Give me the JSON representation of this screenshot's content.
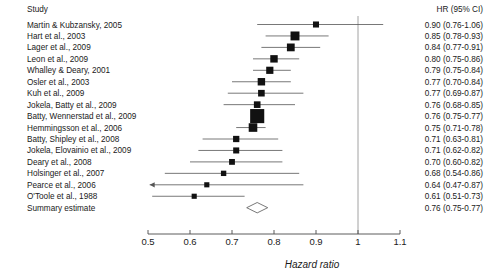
{
  "columns": {
    "study_header": "Study",
    "hr_header": "HR (95% CI)"
  },
  "axis": {
    "title": "Hazard ratio",
    "ticks": [
      "0.5",
      "0.6",
      "0.7",
      "0.8",
      "0.9",
      "1",
      "1.1"
    ],
    "tick_values": [
      0.5,
      0.6,
      0.7,
      0.8,
      0.9,
      1.0,
      1.1
    ],
    "xmin": 0.5,
    "xmax": 1.1,
    "null_value": 1.0
  },
  "chart_data": {
    "type": "forest",
    "title": "",
    "xlabel": "Hazard ratio",
    "ylabel": "",
    "xlim": [
      0.5,
      1.1
    ],
    "xscale": "linear",
    "grid": false,
    "legend": "none",
    "null_line": 1.0,
    "columns": [
      "Study",
      "HR (95% CI)"
    ],
    "studies": [
      {
        "label": "Martin & Kubzansky, 2005",
        "hr": 0.9,
        "lo": 0.76,
        "hi": 1.06,
        "text": "0.90 (0.76-1.06)",
        "weight": 0.3,
        "left_arrow": false,
        "right_arrow": false
      },
      {
        "label": "Hart et al., 2003",
        "hr": 0.85,
        "lo": 0.78,
        "hi": 0.93,
        "text": "0.85 (0.78-0.93)",
        "weight": 0.55,
        "left_arrow": false,
        "right_arrow": false
      },
      {
        "label": "Lager et al., 2009",
        "hr": 0.84,
        "lo": 0.77,
        "hi": 0.91,
        "text": "0.84 (0.77-0.91)",
        "weight": 0.45,
        "left_arrow": false,
        "right_arrow": false
      },
      {
        "label": "Leon et al., 2009",
        "hr": 0.8,
        "lo": 0.75,
        "hi": 0.86,
        "text": "0.80 (0.75-0.86)",
        "weight": 0.42,
        "left_arrow": false,
        "right_arrow": false
      },
      {
        "label": "Whalley & Deary, 2001",
        "hr": 0.79,
        "lo": 0.75,
        "hi": 0.84,
        "text": "0.79 (0.75-0.84)",
        "weight": 0.4,
        "left_arrow": false,
        "right_arrow": false
      },
      {
        "label": "Osler et al., 2003",
        "hr": 0.77,
        "lo": 0.7,
        "hi": 0.84,
        "text": "0.77 (0.70-0.84)",
        "weight": 0.42,
        "left_arrow": false,
        "right_arrow": false
      },
      {
        "label": "Kuh et al., 2009",
        "hr": 0.77,
        "lo": 0.69,
        "hi": 0.87,
        "text": "0.77 (0.69-0.87)",
        "weight": 0.35,
        "left_arrow": false,
        "right_arrow": false
      },
      {
        "label": "Jokela, Batty et al., 2009",
        "hr": 0.76,
        "lo": 0.68,
        "hi": 0.85,
        "text": "0.76 (0.68-0.85)",
        "weight": 0.35,
        "left_arrow": false,
        "right_arrow": false
      },
      {
        "label": "Batty, Wennerstad et al., 2009",
        "hr": 0.76,
        "lo": 0.75,
        "hi": 0.77,
        "text": "0.76 (0.75-0.77)",
        "weight": 1.0,
        "left_arrow": false,
        "right_arrow": false
      },
      {
        "label": "Hemmingsson et al., 2006",
        "hr": 0.75,
        "lo": 0.71,
        "hi": 0.78,
        "text": "0.75 (0.71-0.78)",
        "weight": 0.52,
        "left_arrow": false,
        "right_arrow": false
      },
      {
        "label": "Batty, Shipley et al., 2008",
        "hr": 0.71,
        "lo": 0.63,
        "hi": 0.81,
        "text": "0.71 (0.63-0.81)",
        "weight": 0.32,
        "left_arrow": false,
        "right_arrow": false
      },
      {
        "label": "Jokela, Elovainio et al., 2009",
        "hr": 0.71,
        "lo": 0.62,
        "hi": 0.82,
        "text": "0.71 (0.62-0.82)",
        "weight": 0.3,
        "left_arrow": false,
        "right_arrow": false
      },
      {
        "label": "Deary et al., 2008",
        "hr": 0.7,
        "lo": 0.6,
        "hi": 0.82,
        "text": "0.70 (0.60-0.82)",
        "weight": 0.28,
        "left_arrow": false,
        "right_arrow": false
      },
      {
        "label": "Holsinger et al., 2007",
        "hr": 0.68,
        "lo": 0.54,
        "hi": 0.86,
        "text": "0.68 (0.54-0.86)",
        "weight": 0.24,
        "left_arrow": false,
        "right_arrow": false
      },
      {
        "label": "Pearce et al., 2006",
        "hr": 0.64,
        "lo": 0.47,
        "hi": 0.87,
        "text": "0.64 (0.47-0.87)",
        "weight": 0.22,
        "left_arrow": true,
        "right_arrow": false
      },
      {
        "label": "O'Toole et al., 1988",
        "hr": 0.61,
        "lo": 0.51,
        "hi": 0.73,
        "text": "0.61 (0.51-0.73)",
        "weight": 0.22,
        "left_arrow": false,
        "right_arrow": false
      }
    ],
    "summary": {
      "label": "Summary estimate",
      "hr": 0.76,
      "lo": 0.75,
      "hi": 0.77,
      "text": "0.76 (0.75-0.77)",
      "display_lo": 0.735,
      "display_hi": 0.785
    }
  }
}
